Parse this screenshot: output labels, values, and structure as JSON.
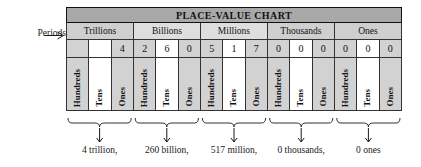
{
  "labels": {
    "periods": "Periods",
    "periods_arrow_icon": "arrow-right-icon"
  },
  "table": {
    "title": "PLACE-VALUE CHART",
    "periods": [
      {
        "name": "Trillions",
        "shaded": true
      },
      {
        "name": "Billions",
        "shaded": false
      },
      {
        "name": "Millions",
        "shaded": false
      },
      {
        "name": "Thousands",
        "shaded": true
      },
      {
        "name": "Ones",
        "shaded": true
      }
    ],
    "columns": [
      {
        "place": "Hundreds",
        "digit": "",
        "shaded": true
      },
      {
        "place": "Tens",
        "digit": "",
        "shaded": false
      },
      {
        "place": "Ones",
        "digit": "4",
        "shaded": true
      },
      {
        "place": "Hundreds",
        "digit": "2",
        "shaded": true
      },
      {
        "place": "Tens",
        "digit": "6",
        "shaded": false
      },
      {
        "place": "Ones",
        "digit": "0",
        "shaded": true
      },
      {
        "place": "Hundreds",
        "digit": "5",
        "shaded": true
      },
      {
        "place": "Tens",
        "digit": "1",
        "shaded": false
      },
      {
        "place": "Ones",
        "digit": "7",
        "shaded": true
      },
      {
        "place": "Hundreds",
        "digit": "0",
        "shaded": true
      },
      {
        "place": "Tens",
        "digit": "0",
        "shaded": false
      },
      {
        "place": "Ones",
        "digit": "0",
        "shaded": true
      },
      {
        "place": "Hundreds",
        "digit": "0",
        "shaded": true
      },
      {
        "place": "Tens",
        "digit": "0",
        "shaded": false
      },
      {
        "place": "Ones",
        "digit": "0",
        "shaded": true
      }
    ]
  },
  "captions": [
    {
      "text": "4 trillion,",
      "center": 151
    },
    {
      "text": "260 billion,",
      "center": 218
    },
    {
      "text": "517 million,",
      "center": 285
    },
    {
      "text": "0 thousands,",
      "center": 352
    },
    {
      "text": "0 ones",
      "center": 419
    }
  ],
  "colors": {
    "title_bg": "#a8a8a8",
    "period_bg": "#cfcfcf",
    "cell_shade": "#d2d2d2",
    "cell_plain": "#ffffff",
    "border": "#333333",
    "text": "#111111"
  }
}
